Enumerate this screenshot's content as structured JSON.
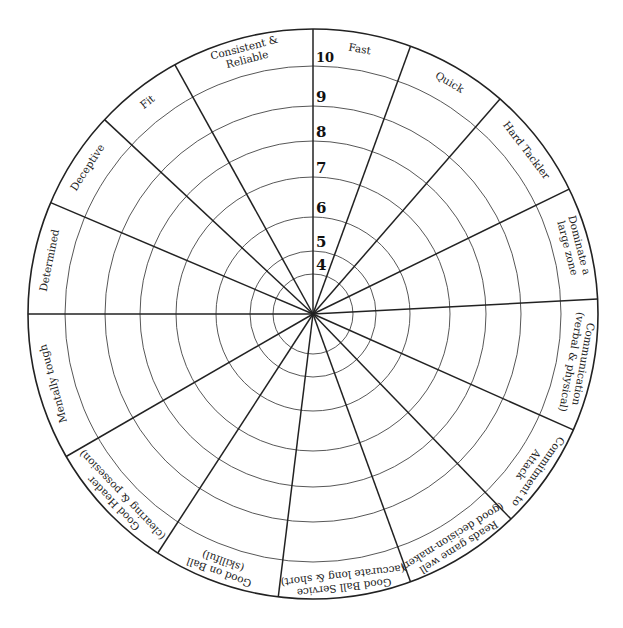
{
  "wheel": {
    "title": "Player attribute wheel",
    "center": [
      313,
      314
    ],
    "outer_radius": 285,
    "colors": {
      "line": "#222222",
      "ring": "#444444",
      "background": "#ffffff"
    },
    "scale": [
      {
        "value": "4",
        "radius": 40
      },
      {
        "value": "5",
        "radius": 63
      },
      {
        "value": "6",
        "radius": 97
      },
      {
        "value": "7",
        "radius": 137
      },
      {
        "value": "8",
        "radius": 173
      },
      {
        "value": "9",
        "radius": 208
      },
      {
        "value": "10",
        "radius": 248
      }
    ],
    "spoke_angles_deg": [
      0,
      20,
      41,
      64,
      87,
      114,
      136,
      160,
      187,
      213,
      240,
      270,
      293,
      313,
      331
    ],
    "segments": [
      {
        "lines": [
          "Fast"
        ]
      },
      {
        "lines": [
          "Quick"
        ]
      },
      {
        "lines": [
          "Hard Tackler"
        ]
      },
      {
        "lines": [
          "Dominate a",
          "large zone"
        ]
      },
      {
        "lines": [
          "Communication",
          "(verbal & physical)"
        ]
      },
      {
        "lines": [
          "Commitment to",
          "Attack"
        ]
      },
      {
        "lines": [
          "Reads game well",
          "(good decision-maker)"
        ]
      },
      {
        "lines": [
          "Good Ball Service",
          "(accurate long & short)"
        ]
      },
      {
        "lines": [
          "Good on Ball",
          "(skillful)"
        ]
      },
      {
        "lines": [
          "Good Header",
          "(clearing & possesion)"
        ]
      },
      {
        "lines": [
          "Mentally tough"
        ]
      },
      {
        "lines": [
          "Determined"
        ]
      },
      {
        "lines": [
          "Deceptive"
        ]
      },
      {
        "lines": [
          "Fit"
        ]
      },
      {
        "lines": [
          "Consistent &",
          "Reliable"
        ]
      }
    ]
  }
}
